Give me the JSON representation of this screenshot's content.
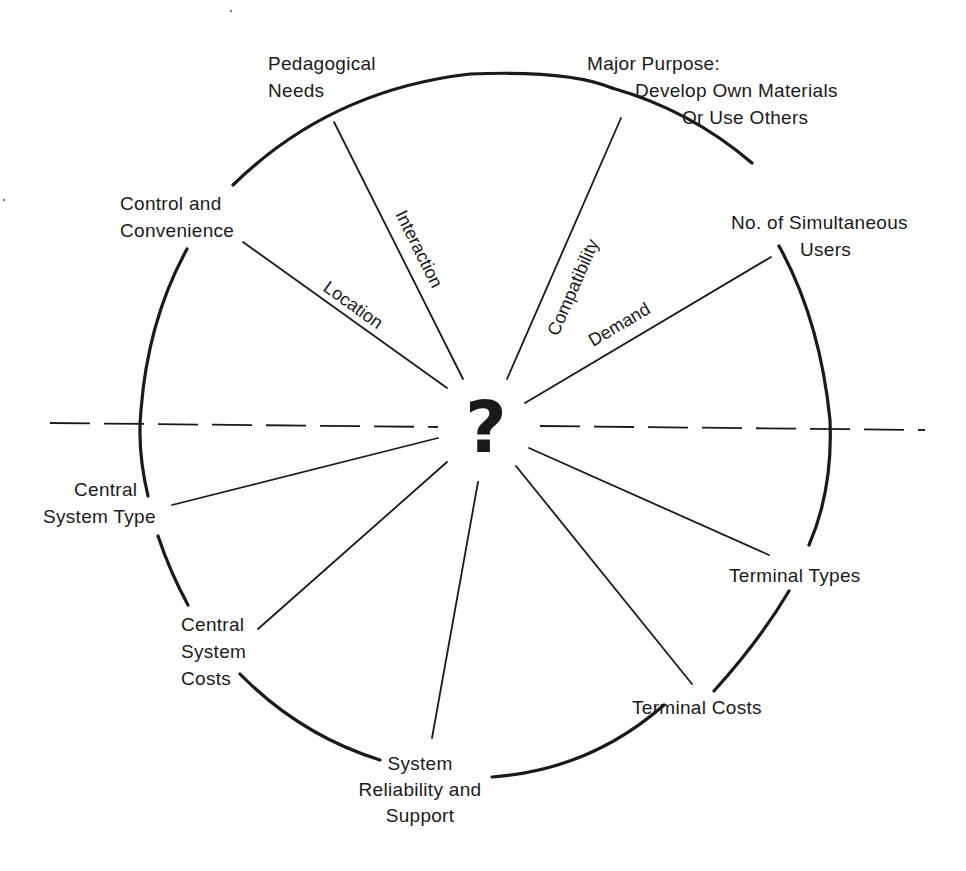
{
  "diagram": {
    "center_symbol": "?",
    "outer_labels": {
      "pedagogical_needs": [
        "Pedagogical",
        "Needs"
      ],
      "major_purpose": [
        "Major Purpose:",
        "Develop Own Materials",
        "Or Use Others"
      ],
      "control_convenience": [
        "Control and",
        "Convenience"
      ],
      "simultaneous_users": [
        "No. of Simultaneous",
        "Users"
      ],
      "central_system_type": [
        "Central",
        "System Type"
      ],
      "terminal_types": [
        "Terminal Types"
      ],
      "central_system_costs": [
        "Central",
        "System",
        "Costs"
      ],
      "terminal_costs": [
        "Terminal Costs"
      ],
      "system_reliability": [
        "System",
        "Reliability and",
        "Support"
      ]
    },
    "spoke_labels": {
      "location": "Location",
      "interaction": "Interaction",
      "compatibility": "Compatibility",
      "demand": "Demand"
    },
    "colors": {
      "ink": "#1a1a1a",
      "background": "#ffffff"
    }
  }
}
